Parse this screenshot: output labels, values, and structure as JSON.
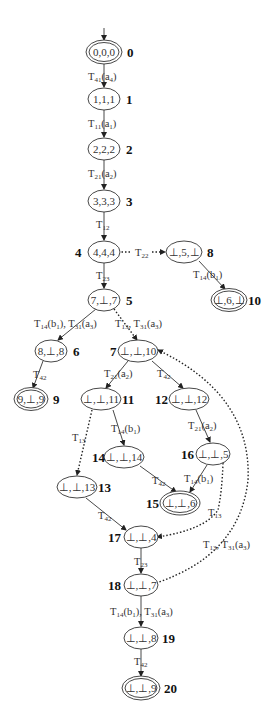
{
  "diagram": {
    "type": "state-transition-graph",
    "nodes": [
      {
        "id": "0",
        "label": "0,0,0",
        "final": true,
        "initial": true,
        "x": 104,
        "y": 52,
        "id_side": "right"
      },
      {
        "id": "1",
        "label": "1,1,1",
        "final": false,
        "x": 104,
        "y": 99,
        "id_side": "right"
      },
      {
        "id": "2",
        "label": "2,2,2",
        "final": false,
        "x": 104,
        "y": 149,
        "id_side": "right"
      },
      {
        "id": "3",
        "label": "3,3,3",
        "final": false,
        "x": 104,
        "y": 201,
        "id_side": "right"
      },
      {
        "id": "4",
        "label": "4,4,4",
        "final": false,
        "x": 104,
        "y": 252,
        "id_side": "left"
      },
      {
        "id": "5",
        "label": "7,⊥,7",
        "final": false,
        "x": 104,
        "y": 300,
        "id_side": "right"
      },
      {
        "id": "6",
        "label": "8,⊥,8",
        "final": false,
        "x": 51,
        "y": 351,
        "id_side": "right"
      },
      {
        "id": "7",
        "label": "⊥,⊥,10",
        "final": false,
        "x": 138,
        "y": 351,
        "id_side": "left"
      },
      {
        "id": "8",
        "label": "⊥,5,⊥",
        "final": false,
        "x": 184,
        "y": 252,
        "id_side": "right"
      },
      {
        "id": "9",
        "label": "9,⊥,9",
        "final": true,
        "x": 31,
        "y": 399,
        "id_side": "right"
      },
      {
        "id": "10",
        "label": "⊥,6,⊥",
        "final": true,
        "x": 229,
        "y": 300,
        "id_side": "right"
      },
      {
        "id": "11",
        "label": "⊥,⊥,11",
        "final": false,
        "x": 101,
        "y": 399,
        "id_side": "right"
      },
      {
        "id": "12",
        "label": "⊥,⊥,12",
        "final": false,
        "x": 189,
        "y": 399,
        "id_side": "left"
      },
      {
        "id": "13",
        "label": "⊥,⊥,13",
        "final": false,
        "x": 77,
        "y": 487,
        "id_side": "right"
      },
      {
        "id": "14",
        "label": "⊥,⊥,14",
        "final": false,
        "x": 124,
        "y": 457,
        "id_side": "left"
      },
      {
        "id": "15",
        "label": "⊥,⊥,6",
        "final": true,
        "x": 180,
        "y": 503,
        "id_side": "left"
      },
      {
        "id": "16",
        "label": "⊥,⊥,5",
        "final": false,
        "x": 213,
        "y": 454,
        "id_side": "left"
      },
      {
        "id": "17",
        "label": "⊥,⊥,4",
        "final": false,
        "x": 141,
        "y": 537,
        "id_side": "left"
      },
      {
        "id": "18",
        "label": "⊥,⊥,7",
        "final": false,
        "x": 141,
        "y": 585,
        "id_side": "left"
      },
      {
        "id": "19",
        "label": "⊥,⊥,8",
        "final": false,
        "x": 141,
        "y": 638,
        "id_side": "right"
      },
      {
        "id": "20",
        "label": "⊥,⊥,9",
        "final": true,
        "x": 141,
        "y": 688,
        "id_side": "right"
      }
    ],
    "edges": [
      {
        "from": "0",
        "to": "1",
        "label": "T41(a4)",
        "style": "solid"
      },
      {
        "from": "1",
        "to": "2",
        "label": "T11(a1)",
        "style": "solid"
      },
      {
        "from": "2",
        "to": "3",
        "label": "T21(a2)",
        "style": "solid"
      },
      {
        "from": "3",
        "to": "4",
        "label": "T12",
        "style": "solid"
      },
      {
        "from": "4",
        "to": "5",
        "label": "T23",
        "style": "solid"
      },
      {
        "from": "4",
        "to": "8",
        "label": "T22",
        "style": "dotted"
      },
      {
        "from": "8",
        "to": "10",
        "label": "T14(b1)",
        "style": "solid"
      },
      {
        "from": "5",
        "to": "6",
        "label": "T14(b1), T31(a3)",
        "style": "solid"
      },
      {
        "from": "5",
        "to": "7",
        "label": "T13, T31(a3)",
        "style": "dotted"
      },
      {
        "from": "6",
        "to": "9",
        "label": "T42",
        "style": "solid"
      },
      {
        "from": "7",
        "to": "11",
        "label": "T21(a2)",
        "style": "solid"
      },
      {
        "from": "7",
        "to": "12",
        "label": "T42",
        "style": "solid"
      },
      {
        "from": "11",
        "to": "13",
        "label": "T13",
        "style": "dotted"
      },
      {
        "from": "11",
        "to": "14",
        "label": "T14(b1)",
        "style": "solid"
      },
      {
        "from": "12",
        "to": "16",
        "label": "T21(a2)",
        "style": "solid"
      },
      {
        "from": "14",
        "to": "15",
        "label": "T42",
        "style": "solid"
      },
      {
        "from": "16",
        "to": "15",
        "label": "T14(b1)",
        "style": "solid"
      },
      {
        "from": "16",
        "to": "17",
        "label": "T13",
        "style": "dotted"
      },
      {
        "from": "13",
        "to": "17",
        "label": "T42",
        "style": "solid"
      },
      {
        "from": "17",
        "to": "18",
        "label": "T23",
        "style": "solid"
      },
      {
        "from": "18",
        "to": "7",
        "label": "T13, T31(a3)",
        "style": "dotted"
      },
      {
        "from": "18",
        "to": "19",
        "label": "T14(b1), T31(a3)",
        "style": "solid"
      },
      {
        "from": "19",
        "to": "20",
        "label": "T42",
        "style": "solid"
      }
    ]
  }
}
